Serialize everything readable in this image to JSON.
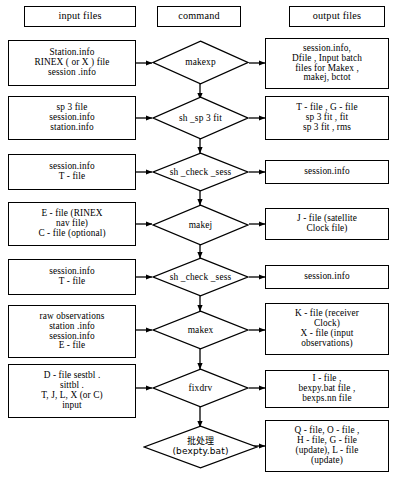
{
  "diagram": {
    "type": "flowchart",
    "columns": [
      {
        "id": "input",
        "label": "input files"
      },
      {
        "id": "command",
        "label": "command"
      },
      {
        "id": "output",
        "label": "output files"
      }
    ],
    "rows": [
      {
        "id": "makexp",
        "input": "Station.info\nRINEX ( or X ) file\nsession .info",
        "command": "makexp",
        "output": "session.info,\nDfile , Input batch\nfiles for Makex ,\nmakej,  bctot"
      },
      {
        "id": "sh_sp3fit",
        "input": "sp 3  file\nsession.info\nstation.info",
        "command": "sh _sp 3 fit",
        "output": "T - file , G - file\nsp 3 fit , fit\nsp 3 fit , rms"
      },
      {
        "id": "sh_check_sess_1",
        "input": "session.info\nT - file",
        "command": "sh _check _sess",
        "output": "session.info"
      },
      {
        "id": "makej",
        "input": "E - file (RINEX\nnav file)\nC - file (optional)",
        "command": "makej",
        "output": "J - file (satellite\nClock file)"
      },
      {
        "id": "sh_check_sess_2",
        "input": "session.info\nT - file",
        "command": "sh _check _sess",
        "output": "session.info"
      },
      {
        "id": "makex",
        "input": "raw observations\nstation .info\nsession.info\nE - file",
        "command": "makex",
        "output": "K - file (receiver\nClock)\nX - file (input\nobservations)"
      },
      {
        "id": "fixdrv",
        "input": "D - file sestbl .\nsittbl .\nT, J, L, X (or C)\ninput",
        "command": "fixdrv",
        "output": "I - file ,\nbexpy.bat file ,\nbexps.nn file"
      },
      {
        "id": "batch",
        "input": "",
        "command": "批处理\n(bexpty.bat)",
        "command_cjk": true,
        "output": "Q - file, O - file ,\nH - file,  G - file\n(update), L - file\n(update)"
      }
    ],
    "colors": {
      "stroke": "#000000",
      "fill": "#ffffff",
      "text": "#000000"
    }
  }
}
